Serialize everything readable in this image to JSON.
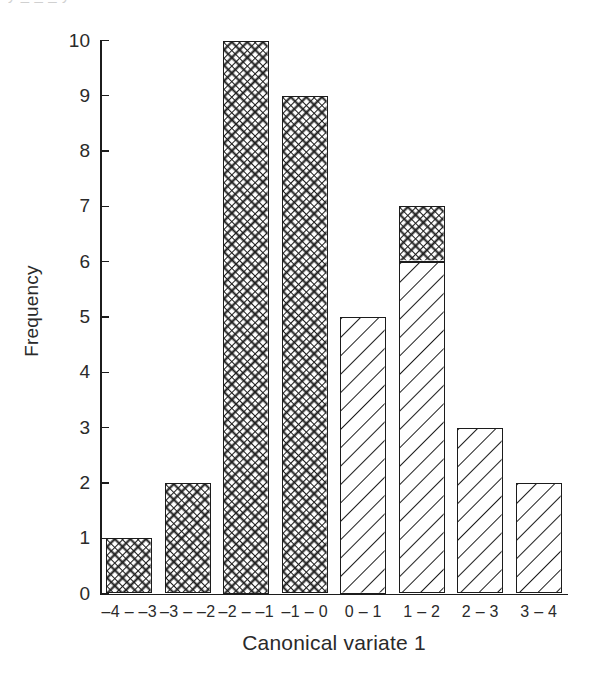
{
  "figure": {
    "top_clipped_caption": "y   _   _   _   y",
    "background_color": "#ffffff",
    "ink_color": "#1c1c1c"
  },
  "chart_data": {
    "type": "bar",
    "title": "",
    "subtitle": "",
    "xlabel": "Canonical variate 1",
    "ylabel": "Frequency",
    "categories": [
      "–4 – –3",
      "–3 – –2",
      "–2 – –1",
      "–1 – 0",
      "0 – 1",
      "1 – 2",
      "2 – 3",
      "3 – 4"
    ],
    "values": [
      1,
      2,
      10,
      9,
      5,
      7,
      3,
      2
    ],
    "stacked": true,
    "series": [
      {
        "name": "cross-hatch group",
        "pattern": "cross-hatch",
        "values": [
          1,
          2,
          10,
          9,
          0,
          1,
          0,
          0
        ]
      },
      {
        "name": "diagonal-hatch group",
        "pattern": "diagonal-hatch",
        "values": [
          0,
          0,
          0,
          0,
          5,
          6,
          3,
          2
        ]
      }
    ],
    "ylim": [
      0,
      10
    ],
    "yticks": [
      0,
      1,
      2,
      3,
      4,
      5,
      6,
      7,
      8,
      9,
      10
    ],
    "ytick_labels": [
      "0",
      "1",
      "2",
      "3",
      "4",
      "5",
      "6",
      "7",
      "8",
      "9",
      "10"
    ],
    "grid": false,
    "legend": "none",
    "bar_fill_color": "#ffffff",
    "bar_edge_color": "#1c1c1c"
  }
}
